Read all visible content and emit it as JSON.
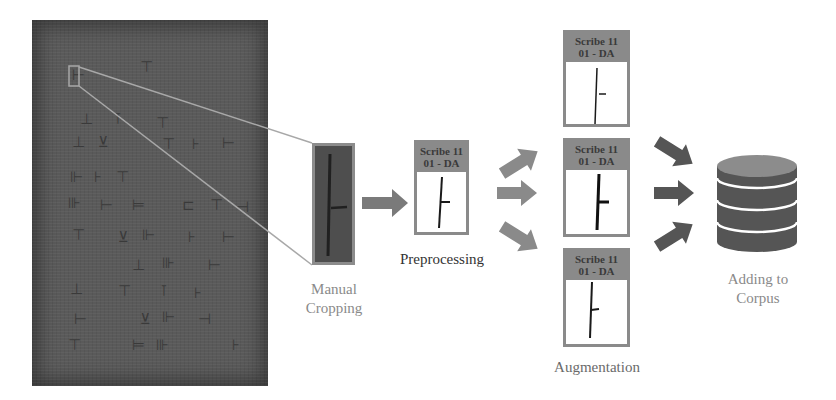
{
  "diagram": {
    "type": "pipeline",
    "stages": [
      {
        "id": "source",
        "label": ""
      },
      {
        "id": "manual-cropping",
        "label_line1": "Manual",
        "label_line2": "Cropping"
      },
      {
        "id": "preprocessing",
        "label": "Preprocessing"
      },
      {
        "id": "augmentation",
        "label": "Augmentation"
      },
      {
        "id": "adding-to-corpus",
        "label_line1": "Adding to",
        "label_line2": "Corpus"
      }
    ],
    "preprocessing_card": {
      "header_line1": "Scribe 11",
      "header_line2": "01 - DA"
    },
    "augmentation_cards": [
      {
        "header_line1": "Scribe 11",
        "header_line2": "01 - DA"
      },
      {
        "header_line1": "Scribe 11",
        "header_line2": "01 - DA"
      },
      {
        "header_line1": "Scribe 11",
        "header_line2": "01 - DA"
      }
    ],
    "colors": {
      "tablet": "#5a5a5a",
      "card_border": "#8a8a8a",
      "arrow_light": "#8a8a8a",
      "arrow_dark": "#555555",
      "database_body": "#555555",
      "database_top": "#8c8c8c",
      "connector_line": "#a8a8a8"
    }
  }
}
